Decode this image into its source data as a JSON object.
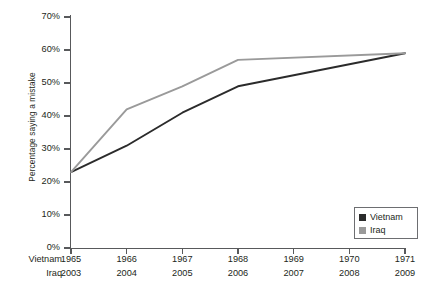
{
  "chart_data": {
    "type": "line",
    "title": "",
    "xlabel": "",
    "ylabel": "Percentage saying a mistake",
    "ylim": [
      0,
      70
    ],
    "ytick_labels": [
      "0%",
      "10%",
      "20%",
      "30%",
      "40%",
      "50%",
      "60%",
      "70%"
    ],
    "ytick_values": [
      0,
      10,
      20,
      30,
      40,
      50,
      60,
      70
    ],
    "grid": false,
    "legend_position": "bottom-right",
    "x_axis_rows": [
      {
        "caption": "Vietnam",
        "labels": [
          "1965",
          "1966",
          "1967",
          "1968",
          "1969",
          "1970",
          "1971"
        ]
      },
      {
        "caption": "Iraq",
        "labels": [
          "2003",
          "2004",
          "2005",
          "2006",
          "2007",
          "2008",
          "2009"
        ]
      }
    ],
    "x_positions": [
      0,
      1,
      2,
      3,
      4,
      5,
      6
    ],
    "series": [
      {
        "name": "Vietnam",
        "color": "#2b2b2b",
        "x": [
          0,
          1,
          2,
          3,
          6
        ],
        "values": [
          23,
          31,
          41,
          49,
          59
        ]
      },
      {
        "name": "Iraq",
        "color": "#9a9a9a",
        "x": [
          0,
          1,
          2,
          3,
          6
        ],
        "values": [
          23,
          42,
          49,
          57,
          59
        ]
      }
    ],
    "legend": [
      {
        "label": "Vietnam",
        "color": "#2b2b2b"
      },
      {
        "label": "Iraq",
        "color": "#9a9a9a"
      }
    ]
  },
  "colors": {
    "axis": "#58595b",
    "text": "#231f20",
    "vietnam": "#2b2b2b",
    "iraq": "#9a9a9a",
    "background": "#ffffff"
  }
}
